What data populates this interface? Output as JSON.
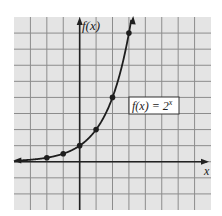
{
  "chart_data": {
    "type": "line",
    "title": "",
    "function_label": "f(x) = 2^x",
    "function_label_base": "f(x) = 2",
    "function_label_exp": "x",
    "xlabel": "x",
    "ylabel": "f(x)",
    "x": [
      -2,
      -1,
      0,
      1,
      2,
      3
    ],
    "series": [
      {
        "name": "f(x) = 2^x",
        "values": [
          0.25,
          0.5,
          1,
          2,
          4,
          8
        ]
      }
    ],
    "xlim": [
      -4,
      8
    ],
    "ylim": [
      -3,
      9
    ],
    "grid": true,
    "tick_labels_shown": false,
    "arrows": {
      "left_end": true,
      "top_end": true
    },
    "colors": {
      "grid_fill": "#e4e4e4",
      "grid_line": "#8c8c8c",
      "axis": "#222222",
      "curve": "#1e1e1e",
      "label_box_fill": "#ffffff",
      "label_box_border": "#333333"
    }
  }
}
